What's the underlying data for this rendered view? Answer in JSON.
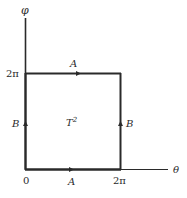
{
  "diagram": {
    "axes": {
      "vertical_label": "φ",
      "horizontal_label": "θ"
    },
    "ticks": {
      "origin": "0",
      "theta_max": "2π",
      "phi_max": "2π"
    },
    "edges": {
      "top": "A",
      "bottom": "A",
      "left": "B",
      "right": "B"
    },
    "region_label": {
      "base": "T",
      "superscript": "2"
    },
    "colors": {
      "line": "#2a2a2a",
      "background": "#ffffff"
    }
  }
}
